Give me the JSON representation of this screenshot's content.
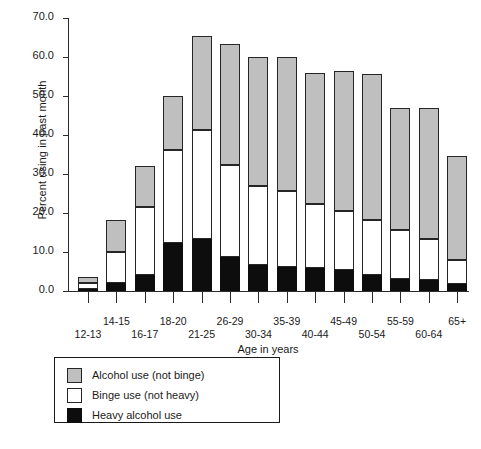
{
  "chart_data": {
    "type": "bar",
    "subtype": "stacked-vertical",
    "title": "",
    "xlabel": "Age in years",
    "ylabel": "Percent using in past month",
    "ylim": [
      0.0,
      70.0
    ],
    "yticks": [
      "0.0",
      "10.0",
      "20.0",
      "30.0",
      "40.0",
      "50.0",
      "60.0",
      "70.0"
    ],
    "ytick_values": [
      0.0,
      10.0,
      20.0,
      30.0,
      40.0,
      50.0,
      60.0,
      70.0
    ],
    "grid": false,
    "legend_position": "below-plot-left",
    "categories": [
      "12-13",
      "14-15",
      "16-17",
      "18-20",
      "21-25",
      "26-29",
      "30-34",
      "35-39",
      "40-44",
      "45-49",
      "50-54",
      "55-59",
      "60-64",
      "65+"
    ],
    "series": [
      {
        "name": "Heavy alcohol use",
        "color": "#0d0d0d",
        "values": [
          0.5,
          2.0,
          4.1,
          12.3,
          13.4,
          8.7,
          6.7,
          6.1,
          6.0,
          5.4,
          4.0,
          3.2,
          2.7,
          1.7
        ]
      },
      {
        "name": "Binge use (not heavy)",
        "color": "#ffffff",
        "values": [
          1.5,
          8.0,
          17.4,
          23.9,
          27.9,
          23.6,
          20.3,
          19.6,
          16.3,
          15.0,
          14.3,
          12.5,
          10.7,
          6.2
        ]
      },
      {
        "name": "Alcohol use (not binge)",
        "color": "#bfbfbf",
        "values": [
          1.5,
          8.2,
          10.5,
          13.9,
          24.2,
          31.1,
          32.9,
          34.2,
          33.6,
          36.1,
          37.3,
          31.2,
          33.5,
          26.6
        ]
      }
    ],
    "totals": [
      3.5,
      18.2,
      32.0,
      50.1,
      65.5,
      63.4,
      59.9,
      59.9,
      55.9,
      56.5,
      55.6,
      46.9,
      46.9,
      34.5
    ]
  },
  "legend": {
    "items": [
      {
        "label": "Alcohol use (not binge)",
        "swatch": "#bfbfbf"
      },
      {
        "label": "Binge use (not heavy)",
        "swatch": "#ffffff"
      },
      {
        "label": "Heavy alcohol use",
        "swatch": "#0d0d0d"
      }
    ]
  }
}
